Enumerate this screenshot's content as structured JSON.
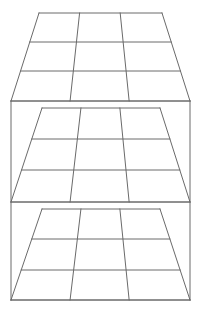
{
  "figure": {
    "canvas": {
      "width": 204,
      "height": 313
    },
    "background_color": "#ffffff",
    "line_color": "#6a6a6a",
    "line_width": 1,
    "panel_count": 3,
    "rows_per_panel": 3,
    "columns_per_panel": 3
  },
  "panels": [
    {
      "name": "top-panel",
      "label": "Top panel",
      "top_edge": {
        "left_x": 39,
        "right_x": 162,
        "y": 13
      },
      "bottom_edge": {
        "left_x": 11,
        "right_x": 190,
        "y": 101
      },
      "row_dividers_y": [
        42,
        71
      ],
      "column_divider_fractions": [
        0.33,
        0.66
      ]
    },
    {
      "name": "middle-panel",
      "label": "Middle panel",
      "top_edge": {
        "left_x": 42,
        "right_x": 160,
        "y": 108
      },
      "bottom_edge": {
        "left_x": 11,
        "right_x": 190,
        "y": 202
      },
      "row_dividers_y": [
        139,
        170
      ],
      "column_divider_fractions": [
        0.33,
        0.66
      ]
    },
    {
      "name": "bottom-panel",
      "label": "Bottom panel",
      "top_edge": {
        "left_x": 42,
        "right_x": 160,
        "y": 209
      },
      "bottom_edge": {
        "left_x": 11,
        "right_x": 190,
        "y": 300
      },
      "row_dividers_y": [
        239,
        270
      ],
      "column_divider_fractions": [
        0.33,
        0.66
      ]
    }
  ],
  "rails": [
    {
      "name": "rail-upper",
      "y": 101,
      "left_x": 11,
      "right_x": 190
    },
    {
      "name": "rail-middle",
      "y": 202,
      "left_x": 11,
      "right_x": 190
    },
    {
      "name": "rail-lower",
      "y": 300,
      "left_x": 11,
      "right_x": 190
    }
  ],
  "posts": [
    {
      "name": "post-left",
      "x": 11,
      "top_y": 101,
      "bottom_y": 300
    },
    {
      "name": "post-right",
      "x": 190,
      "top_y": 101,
      "bottom_y": 300
    }
  ]
}
